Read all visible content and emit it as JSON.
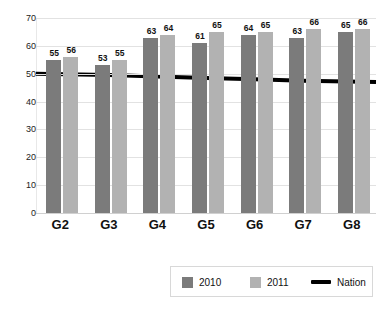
{
  "chart_data": {
    "type": "bar",
    "title": "",
    "xlabel": "",
    "ylabel": "",
    "ylim": [
      0,
      70
    ],
    "yticks": [
      0,
      10,
      20,
      30,
      40,
      50,
      60,
      70
    ],
    "grid": true,
    "legend_position": "bottom",
    "categories": [
      "G2",
      "G3",
      "G4",
      "G5",
      "G6",
      "G7",
      "G8"
    ],
    "series": [
      {
        "name": "2010",
        "type": "bar",
        "color": "#7b7b7b",
        "values": [
          55,
          53,
          63,
          61,
          64,
          63,
          65
        ]
      },
      {
        "name": "2011",
        "type": "bar",
        "color": "#b2b2b2",
        "values": [
          56,
          55,
          64,
          65,
          65,
          66,
          66
        ]
      },
      {
        "name": "Nation",
        "type": "line",
        "color": "#000000",
        "values": [
          50,
          49.5,
          49,
          48.5,
          48,
          47.5,
          47
        ]
      }
    ]
  },
  "legend": {
    "items": [
      {
        "label": "2010",
        "marker": "square-swatch",
        "color": "#7b7b7b"
      },
      {
        "label": "2011",
        "marker": "square-swatch",
        "color": "#b2b2b2"
      },
      {
        "label": "Nation",
        "marker": "line-swatch",
        "color": "#000000"
      }
    ]
  }
}
